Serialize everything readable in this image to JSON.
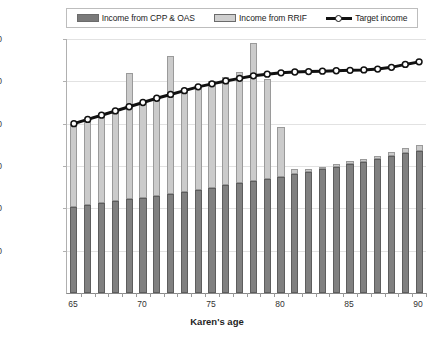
{
  "chart_data": {
    "type": "bar",
    "subtype": "stacked-bar-with-line",
    "title": "",
    "xlabel": "Karen's age",
    "ylabel": "",
    "ylim": [
      0,
      60000
    ],
    "ytick_labels": [
      "$10,000",
      "$20,000",
      "$30,000",
      "$40,000",
      "$50,000",
      "$60,000"
    ],
    "ytick_values": [
      10000,
      20000,
      30000,
      40000,
      50000,
      60000
    ],
    "grid": true,
    "legend_position": "top",
    "categories": [
      65,
      66,
      67,
      68,
      69,
      70,
      71,
      72,
      73,
      74,
      75,
      76,
      77,
      78,
      79,
      80,
      81,
      82,
      83,
      84,
      85,
      86,
      87,
      88,
      89,
      90
    ],
    "xtick_labels": [
      "65",
      "70",
      "75",
      "80",
      "85",
      "90"
    ],
    "xtick_values": [
      65,
      70,
      75,
      80,
      85,
      90
    ],
    "series": [
      {
        "name": "Income from CPP & OAS",
        "color": "#808080",
        "values": [
          20400,
          20800,
          21200,
          21700,
          22100,
          22500,
          23000,
          23400,
          23900,
          24400,
          24900,
          25400,
          25900,
          26400,
          27000,
          27500,
          28100,
          28700,
          29200,
          29800,
          30400,
          31000,
          31700,
          32300,
          33000,
          33600
        ]
      },
      {
        "name": "Income from RRIF",
        "color": "#cbcbcb",
        "values": [
          19600,
          20200,
          20800,
          21300,
          29900,
          22500,
          23000,
          32600,
          24100,
          24600,
          25100,
          25700,
          26200,
          32600,
          23600,
          11700,
          1100,
          600,
          600,
          600,
          700,
          700,
          700,
          1100,
          1200,
          1400
        ]
      }
    ],
    "line_series": {
      "name": "Target income",
      "color": "#111111",
      "marker": "circle-open",
      "values": [
        40000,
        41000,
        42000,
        43000,
        44000,
        45000,
        46000,
        46900,
        47800,
        48700,
        49400,
        50100,
        50700,
        51300,
        51700,
        52000,
        52200,
        52300,
        52400,
        52500,
        52600,
        52700,
        52900,
        53300,
        54000,
        54600
      ]
    }
  },
  "legend": {
    "items": [
      {
        "label": "Income from CPP & OAS",
        "swatch": "cpp-swatch"
      },
      {
        "label": "Income from RRIF",
        "swatch": "rrif-swatch"
      },
      {
        "label": "Target income",
        "swatch": "target-line-swatch"
      }
    ]
  },
  "axis": {
    "x_title": "Karen's age"
  }
}
